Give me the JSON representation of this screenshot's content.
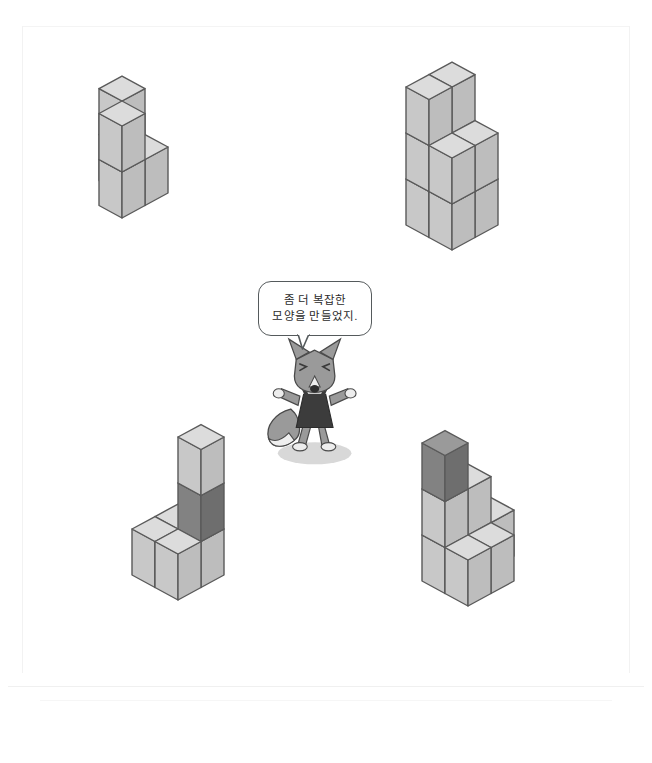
{
  "page": {
    "background_color": "#ffffff"
  },
  "speech_bubble": {
    "name": "fox-speech-bubble",
    "line1": "좀 더 복잡한",
    "line2": "모양을 만들었지.",
    "border_color": "#555a5c",
    "fill_color": "#ffffff"
  },
  "character": {
    "name": "fox-character",
    "species": "fox",
    "body_color": "#9a9a9a",
    "outfit_color": "#3c3c3c",
    "outline_color": "#4a4a4a",
    "shadow_color": "#d8d8d8"
  },
  "cube_colors": {
    "light_top": "#dcdcdc",
    "light_left": "#c8c8c8",
    "light_right": "#bdbdbd",
    "dark_top": "#9a9a9a",
    "dark_left": "#828282",
    "dark_right": "#6e6e6e",
    "outline": "#5a5a5a"
  },
  "figures": [
    {
      "name": "figure-top-left",
      "label": "U-shaped structure",
      "cube_count": 5,
      "cube_size": 46,
      "origin": {
        "x": 122,
        "y": 218
      },
      "cubes": [
        {
          "x": 0,
          "y": 0,
          "z": 0,
          "shade": "light"
        },
        {
          "x": 1,
          "y": 0,
          "z": 0,
          "shade": "light"
        },
        {
          "x": 1,
          "y": 1,
          "z": 0,
          "shade": "light"
        },
        {
          "x": 0,
          "y": 0,
          "z": 1,
          "shade": "light"
        },
        {
          "x": 1,
          "y": 1,
          "z": 1,
          "shade": "light"
        }
      ]
    },
    {
      "name": "figure-top-right",
      "label": "Stepped block structure",
      "cube_count": 10,
      "cube_size": 46,
      "origin": {
        "x": 452,
        "y": 250
      },
      "cubes": [
        {
          "x": 0,
          "y": 0,
          "z": 0,
          "shade": "light"
        },
        {
          "x": 1,
          "y": 0,
          "z": 0,
          "shade": "light"
        },
        {
          "x": 0,
          "y": 1,
          "z": 0,
          "shade": "light"
        },
        {
          "x": 1,
          "y": 1,
          "z": 0,
          "shade": "light"
        },
        {
          "x": 0,
          "y": 0,
          "z": 1,
          "shade": "light"
        },
        {
          "x": 1,
          "y": 0,
          "z": 1,
          "shade": "light"
        },
        {
          "x": 0,
          "y": 1,
          "z": 1,
          "shade": "light"
        },
        {
          "x": 1,
          "y": 1,
          "z": 1,
          "shade": "light"
        },
        {
          "x": 0,
          "y": 1,
          "z": 2,
          "shade": "light"
        },
        {
          "x": 1,
          "y": 1,
          "z": 2,
          "shade": "light"
        }
      ]
    },
    {
      "name": "figure-bottom-left",
      "label": "Cross with tower, one dark cube",
      "cube_count": 6,
      "dark_cube_count": 1,
      "cube_size": 46,
      "origin": {
        "x": 178,
        "y": 600
      },
      "cubes": [
        {
          "x": 0,
          "y": 0,
          "z": 0,
          "shade": "light"
        },
        {
          "x": 1,
          "y": 0,
          "z": 0,
          "shade": "light"
        },
        {
          "x": 0,
          "y": 1,
          "z": 0,
          "shade": "light"
        },
        {
          "x": 1,
          "y": 1,
          "z": 0,
          "shade": "light"
        },
        {
          "x": 1,
          "y": 0,
          "z": 1,
          "shade": "dark"
        },
        {
          "x": 1,
          "y": 0,
          "z": 2,
          "shade": "light"
        }
      ]
    },
    {
      "name": "figure-bottom-right",
      "label": "Staircase structure with dark top cube",
      "cube_count": 8,
      "dark_cube_count": 1,
      "cube_size": 46,
      "origin": {
        "x": 468,
        "y": 606
      },
      "cubes": [
        {
          "x": 0,
          "y": 0,
          "z": 0,
          "shade": "light"
        },
        {
          "x": 1,
          "y": 0,
          "z": 0,
          "shade": "light"
        },
        {
          "x": 0,
          "y": 1,
          "z": 0,
          "shade": "light"
        },
        {
          "x": 1,
          "y": 1,
          "z": 0,
          "shade": "light"
        },
        {
          "x": 2,
          "y": 1,
          "z": 0,
          "shade": "light"
        },
        {
          "x": 0,
          "y": 1,
          "z": 1,
          "shade": "light"
        },
        {
          "x": 1,
          "y": 1,
          "z": 1,
          "shade": "light"
        },
        {
          "x": 0,
          "y": 1,
          "z": 2,
          "shade": "dark"
        }
      ]
    }
  ]
}
